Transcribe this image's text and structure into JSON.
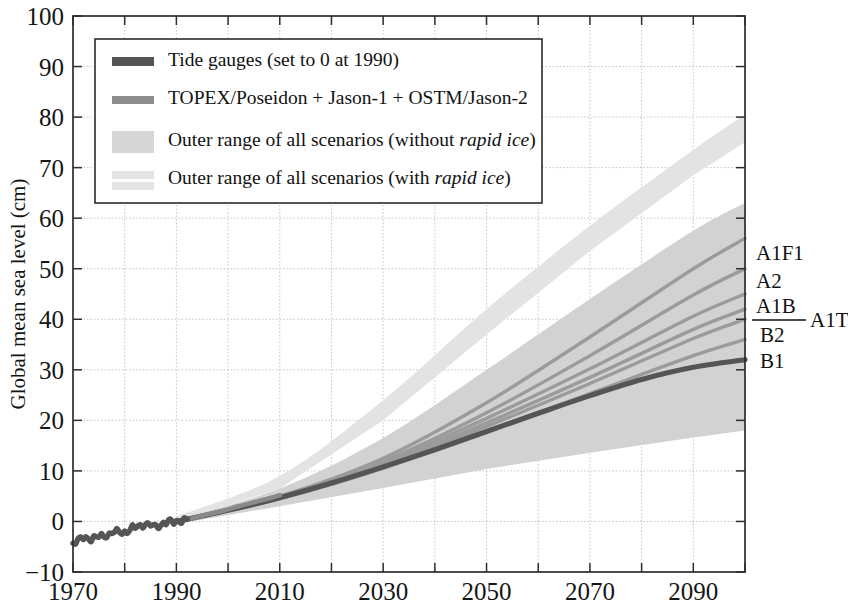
{
  "figure": {
    "title": "",
    "background_color": "#ffffff"
  },
  "axes": {
    "ylabel": "Global mean sea level (cm)",
    "xlabel": "",
    "y_ticks": [
      "-10",
      "0",
      "10",
      "20",
      "30",
      "40",
      "50",
      "60",
      "70",
      "80",
      "90",
      "100"
    ],
    "x_ticks": [
      "1970",
      "1990",
      "2010",
      "2030",
      "2050",
      "2070",
      "2090"
    ]
  },
  "legend": {
    "entries": [
      {
        "key": "tide-gauges",
        "label": "Tide gauges (set to 0 at 1990)",
        "swatch": "thick-dark-line",
        "color": "#555555"
      },
      {
        "key": "satellite-altimetry",
        "label": "TOPEX/Poseidon + Jason-1 + OSTM/Jason-2",
        "swatch": "thick-mid-line",
        "color": "#8a8a8a"
      },
      {
        "key": "outer-range-without-rapid-ice",
        "label_plain": "Outer range of all scenarios (without ",
        "label_italic": "rapid ice",
        "label_tail": ")",
        "label": "Outer range of all scenarios (without rapid ice)",
        "swatch": "light-gray-patch",
        "color": "#d2d2d2"
      },
      {
        "key": "outer-range-with-rapid-ice",
        "label_plain": "Outer range of all scenarios (with ",
        "label_italic": "rapid ice",
        "label_tail": ")",
        "label": "Outer range of all scenarios (with rapid ice)",
        "swatch": "very-light-gray-patch",
        "color": "#e2e2e2"
      }
    ]
  },
  "scenario_labels": [
    {
      "key": "a1f1",
      "text": "A1F1",
      "value_2100": 56
    },
    {
      "key": "a2",
      "text": "A2",
      "value_2100": 50
    },
    {
      "key": "a1b",
      "text": "A1B",
      "value_2100": 45
    },
    {
      "key": "a1t",
      "text": "A1T",
      "value_2100": 42
    },
    {
      "key": "b2",
      "text": "B2",
      "value_2100": 40
    },
    {
      "key": "b1",
      "text": "B1",
      "value_2100": 36
    }
  ],
  "colors": {
    "tide_gauge": "#555555",
    "satellite": "#8a8a8a",
    "band_without_rapid_ice": "#d2d2d2",
    "band_with_rapid_ice": "#e3e3e3",
    "scenario_line": "#9b9b9b",
    "axis": "#2d2d2d",
    "grid": "#b9b9b9"
  },
  "chart_data": {
    "type": "line",
    "title": "",
    "xlabel": "",
    "ylabel": "Global mean sea level (cm)",
    "xlim": [
      1970,
      2100
    ],
    "ylim": [
      -10,
      100
    ],
    "grid": true,
    "legend_position": "upper-left-inside",
    "x_tick_values": [
      1970,
      1990,
      2010,
      2030,
      2050,
      2070,
      2090
    ],
    "x_minor_tick_values": [
      1980,
      2000,
      2020,
      2040,
      2060,
      2080,
      2100
    ],
    "y_tick_values": [
      -10,
      0,
      10,
      20,
      30,
      40,
      50,
      60,
      70,
      80,
      90,
      100
    ],
    "annotations": [
      "A1F1",
      "A2",
      "A1B",
      "A1T",
      "B2",
      "B1"
    ],
    "series": [
      {
        "name": "Tide gauges (set to 0 at 1990)",
        "type": "line",
        "color": "#555555",
        "x": [
          1970,
          1972,
          1974,
          1976,
          1978,
          1980,
          1982,
          1984,
          1986,
          1988,
          1990,
          1992
        ],
        "values": [
          -4.0,
          -3.5,
          -3.2,
          -2.8,
          -2.2,
          -2.0,
          -1.2,
          -0.6,
          -0.9,
          -0.3,
          0.0,
          0.4
        ]
      },
      {
        "name": "TOPEX/Poseidon + Jason-1 + OSTM/Jason-2",
        "type": "line",
        "color": "#8a8a8a",
        "x": [
          1993,
          1996,
          1999,
          2002,
          2005,
          2008,
          2010
        ],
        "values": [
          0.6,
          1.4,
          2.1,
          3.0,
          3.8,
          4.6,
          5.2
        ]
      },
      {
        "name": "Observed / central projection (extension of tide gauge trend)",
        "type": "line",
        "color": "#555555",
        "x": [
          1990,
          2000,
          2010,
          2020,
          2030,
          2040,
          2050,
          2060,
          2070,
          2080,
          2090,
          2100
        ],
        "values": [
          0,
          2.2,
          4.7,
          7.6,
          10.8,
          14.2,
          17.8,
          21.4,
          24.9,
          28.1,
          30.5,
          32.0
        ]
      },
      {
        "name": "A1F1",
        "type": "line",
        "color": "#9b9b9b",
        "x": [
          1990,
          2010,
          2030,
          2050,
          2070,
          2090,
          2100
        ],
        "values": [
          0,
          5.0,
          12.5,
          23.5,
          36.5,
          50.0,
          56.0
        ]
      },
      {
        "name": "A2",
        "type": "line",
        "color": "#9b9b9b",
        "x": [
          1990,
          2010,
          2030,
          2050,
          2070,
          2090,
          2100
        ],
        "values": [
          0,
          4.9,
          11.9,
          21.5,
          32.8,
          44.8,
          50.0
        ]
      },
      {
        "name": "A1B",
        "type": "line",
        "color": "#9b9b9b",
        "x": [
          1990,
          2010,
          2030,
          2050,
          2070,
          2090,
          2100
        ],
        "values": [
          0,
          4.8,
          11.6,
          20.4,
          30.2,
          40.6,
          45.0
        ]
      },
      {
        "name": "A1T",
        "type": "line",
        "color": "#9b9b9b",
        "x": [
          1990,
          2010,
          2030,
          2050,
          2070,
          2090,
          2100
        ],
        "values": [
          0,
          4.7,
          11.2,
          19.5,
          28.5,
          38.0,
          42.0
        ]
      },
      {
        "name": "B2",
        "type": "line",
        "color": "#9b9b9b",
        "x": [
          1990,
          2010,
          2030,
          2050,
          2070,
          2090,
          2100
        ],
        "values": [
          0,
          4.6,
          10.9,
          18.8,
          27.3,
          36.2,
          40.0
        ]
      },
      {
        "name": "B1",
        "type": "line",
        "color": "#9b9b9b",
        "x": [
          1990,
          2010,
          2030,
          2050,
          2070,
          2090,
          2100
        ],
        "values": [
          0,
          4.5,
          10.5,
          17.8,
          25.3,
          32.8,
          36.0
        ]
      }
    ],
    "bands": [
      {
        "name": "Outer range of all scenarios (without rapid ice)",
        "color": "#d2d2d2",
        "x": [
          1990,
          2010,
          2030,
          2050,
          2070,
          2090,
          2100
        ],
        "upper": [
          0.5,
          6.5,
          16.5,
          30.0,
          44.0,
          57.5,
          63.0
        ],
        "lower": [
          -0.5,
          3.0,
          6.6,
          10.4,
          13.6,
          16.6,
          18.0
        ]
      },
      {
        "name": "Outer range of all scenarios (with rapid ice)",
        "color": "#e3e3e3",
        "x": [
          1990,
          2010,
          2030,
          2050,
          2070,
          2090,
          2100
        ],
        "upper": [
          1.0,
          9.0,
          24.0,
          42.0,
          58.5,
          73.5,
          80.5
        ],
        "lower": [
          0.0,
          6.5,
          20.0,
          37.0,
          53.5,
          68.5,
          75.0
        ]
      }
    ]
  }
}
